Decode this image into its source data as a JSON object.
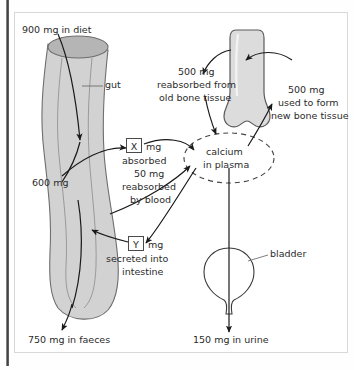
{
  "diagram": {
    "colors": {
      "organ_fill": "#d2d2d2",
      "organ_stroke": "#6e6e6e",
      "lumen_fill": "#b5b5b5",
      "arrow": "#1a1a1a",
      "text": "#2b2b2b",
      "frame": "#d8d8d8",
      "spine": "#3a3a3a"
    },
    "labels": {
      "diet": "900 mg in diet",
      "gut": "gut",
      "gut_remaining": "600 mg",
      "absorbed_value": "X",
      "absorbed_unit": "mg",
      "absorbed_text": "absorbed",
      "reabsorbed_blood_value": "50 mg",
      "reabsorbed_blood_line1": "reabsorbed",
      "reabsorbed_blood_line2": "by blood",
      "secreted_value": "Y",
      "secreted_unit": "mg",
      "secreted_line1": "secreted into",
      "secreted_line2": "intestine",
      "faeces": "750 mg in faeces",
      "plasma_line1": "calcium",
      "plasma_line2": "in plasma",
      "bone_old_value": "500 mg",
      "bone_old_line1": "reabsorbed from",
      "bone_old_line2": "old bone tissue",
      "bone_new_value": "500 mg",
      "bone_new_line1": "used to form",
      "bone_new_line2": "new bone tissue",
      "bladder": "bladder",
      "urine": "150 mg in urine"
    }
  }
}
